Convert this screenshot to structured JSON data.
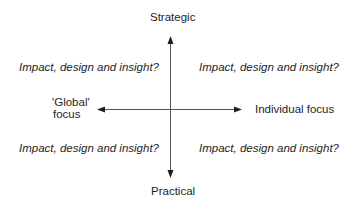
{
  "diagram": {
    "type": "quadrant",
    "axes": {
      "vertical": {
        "top_label": "Strategic",
        "bottom_label": "Practical"
      },
      "horizontal": {
        "left_label_line1": "'Global'",
        "left_label_line2": "focus",
        "right_label": "Individual focus"
      }
    },
    "quadrants": {
      "top_left": "Impact, design and insight?",
      "top_right": "Impact, design and insight?",
      "bottom_left": "Impact, design and insight?",
      "bottom_right": "Impact, design and insight?"
    },
    "colors": {
      "axis_line": "#555555",
      "text": "#1e1e1e",
      "background": "#ffffff"
    }
  }
}
